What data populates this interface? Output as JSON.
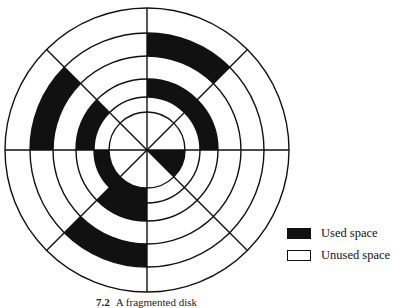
{
  "figure": {
    "caption_number": "7.2",
    "caption_text": "A fragmented disk"
  },
  "disk": {
    "center": [
      147,
      150
    ],
    "ring_radii": [
      38,
      53,
      71,
      94,
      117,
      142
    ],
    "sector_count": 8,
    "sector_order_note": "sectors start at 12 o'clock, clockwise: N-NE, NE-E, E-SE, SE-S, S-SW, SW-W, W-NW, NW-N",
    "used_cells": [
      {
        "ring": 1,
        "sector": "E-SE"
      },
      {
        "ring": 2,
        "sector": "S-SW"
      },
      {
        "ring": 2,
        "sector": "SW-W"
      },
      {
        "ring": 3,
        "sector": "N-NE"
      },
      {
        "ring": 3,
        "sector": "NE-E"
      },
      {
        "ring": 3,
        "sector": "S-SW"
      },
      {
        "ring": 3,
        "sector": "W-NW"
      },
      {
        "ring": 5,
        "sector": "N-NE"
      },
      {
        "ring": 5,
        "sector": "S-SW"
      },
      {
        "ring": 5,
        "sector": "W-NW"
      }
    ],
    "colors": {
      "used": "#111111",
      "unused": "#ffffff",
      "line": "#111111"
    }
  },
  "legend": {
    "items": [
      {
        "label": "Used space",
        "kind": "used"
      },
      {
        "label": "Unused space",
        "kind": "unused"
      }
    ]
  }
}
